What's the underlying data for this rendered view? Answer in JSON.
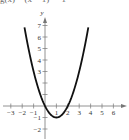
{
  "header": {
    "title_fragment": "g(x) = (x − 1)² − 1"
  },
  "chart_data": {
    "type": "line",
    "title": "g(x) = (x − 1)² − 1",
    "xlabel": "x",
    "ylabel": "y",
    "xlim": [
      -3,
      6
    ],
    "ylim": [
      -2,
      7
    ],
    "x_ticks": [
      -3,
      -2,
      -1,
      1,
      2,
      3,
      4,
      5,
      6
    ],
    "y_ticks": [
      -2,
      -1,
      3,
      4,
      5,
      6,
      7
    ],
    "x_tick_labels": [
      "−3",
      "−2",
      "−1",
      "1",
      "2",
      "3",
      "4",
      "5",
      "6"
    ],
    "y_tick_labels": [
      "−2",
      "−1",
      "3",
      "4",
      "5",
      "6",
      "7"
    ],
    "grid": false,
    "legend": null,
    "series": [
      {
        "name": "g(x) = x² − 2x",
        "color": "#111111",
        "x": [
          -1.8,
          -1.5,
          -1,
          -0.5,
          0,
          0.5,
          1,
          1.5,
          2,
          2.5,
          3,
          3.5,
          3.8
        ],
        "y": [
          6.84,
          5.25,
          3,
          1.25,
          0,
          -0.75,
          -1,
          -0.75,
          0,
          1.25,
          3,
          5.25,
          6.84
        ]
      }
    ],
    "annotations": {
      "vertex": [
        1,
        -1
      ],
      "x_intercepts": [
        0,
        2
      ]
    }
  }
}
